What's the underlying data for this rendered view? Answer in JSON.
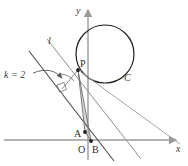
{
  "figure": {
    "kind": "plane-geometry-diagram",
    "width": 188,
    "height": 166,
    "background_color": "#ffffff"
  },
  "axes": {
    "x_axis": {
      "label": "x",
      "color": "#9a9a9a",
      "y_pixel": 140,
      "x_start": 4,
      "x_end": 178,
      "arrow": true
    },
    "y_axis": {
      "label": "y",
      "color": "#9a9a9a",
      "x_pixel": 88,
      "y_start": 160,
      "y_end": 8,
      "arrow": true
    },
    "origin": {
      "label": "O",
      "x_pixel": 83,
      "y_pixel": 149
    }
  },
  "circle": {
    "label": "C",
    "color": "#1f1f1f",
    "center_x": 105,
    "center_y": 54,
    "radius": 29,
    "label_x": 124,
    "label_y": 79
  },
  "lines": [
    {
      "name": "line-l",
      "label": "l",
      "color": "#8e8e8e",
      "x1": 47,
      "y1": 39,
      "x2": 141,
      "y2": 159,
      "label_x": 48,
      "label_y": 43,
      "width": 1
    },
    {
      "name": "line-k",
      "label": "k = 2",
      "color": "#4a4a4a",
      "x1": 29,
      "y1": 51,
      "x2": 114,
      "y2": 161,
      "label_x": 6,
      "label_y": 77,
      "width": 1.1
    },
    {
      "name": "line-p-to-far-right",
      "color": "#a5a5a5",
      "x1": 78,
      "y1": 70,
      "x2": 178,
      "y2": 143,
      "width": 1
    }
  ],
  "segments": [
    {
      "name": "segment-pa",
      "x1": 78,
      "y1": 70,
      "x2": 85,
      "y2": 132,
      "color": "#6e6e6e"
    },
    {
      "name": "segment-pb",
      "x1": 78,
      "y1": 70,
      "x2": 91,
      "y2": 141,
      "color": "#6e6e6e"
    },
    {
      "name": "segment-ab",
      "x1": 85,
      "y1": 132,
      "x2": 91,
      "y2": 141,
      "color": "#6e6e6e"
    }
  ],
  "triangle_fill": {
    "name": "triangle-pab",
    "points": "78,70 85,132 91,141",
    "color": "#bdbdbd",
    "opacity": 0.55
  },
  "points": [
    {
      "name": "point-p",
      "label": "P",
      "x": 78,
      "y": 70,
      "label_x": 80,
      "label_y": 66,
      "dot": true
    },
    {
      "name": "point-a",
      "label": "A",
      "x": 85,
      "y": 132,
      "label_x": 75,
      "label_y": 136,
      "dot": true
    },
    {
      "name": "point-b",
      "label": "B",
      "x": 91,
      "y": 141,
      "label_x": 93,
      "label_y": 152,
      "dot": true
    }
  ],
  "annotations": {
    "right_angle": {
      "name": "right-angle-marker",
      "color": "#6e6e6e",
      "points": "58,85 65,83 67,90 60,92"
    },
    "angle_arc": {
      "name": "angle-arc",
      "color": "#6e6e6e",
      "path": "M 62 76 A 16 16 0 0 1 74 82"
    },
    "leader_arrow": {
      "name": "k-label-leader-arrow",
      "color": "#5a5a5a",
      "path": "M 32 74 C 45 70 54 72 62 79"
    }
  },
  "labels": {
    "k_value": "k = 2",
    "line_l": "l",
    "circle_c": "C",
    "axis_x": "x",
    "axis_y": "y",
    "origin": "O",
    "point_p": "P",
    "point_a": "A",
    "point_b": "B"
  }
}
